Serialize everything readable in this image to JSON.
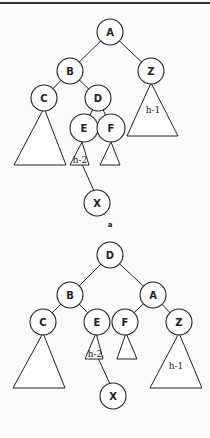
{
  "caption": "a",
  "diagrams": [
    {
      "name": "before-rotation",
      "nodes": {
        "A": {
          "label": "A"
        },
        "B": {
          "label": "B"
        },
        "Z": {
          "label": "Z"
        },
        "C": {
          "label": "C"
        },
        "D": {
          "label": "D"
        },
        "E": {
          "label": "E"
        },
        "F": {
          "label": "F"
        },
        "X": {
          "label": "X"
        }
      },
      "subtrees": {
        "E": "h-2",
        "Z": "h-1"
      }
    },
    {
      "name": "after-rotation",
      "nodes": {
        "D": {
          "label": "D"
        },
        "B": {
          "label": "B"
        },
        "A": {
          "label": "A"
        },
        "C": {
          "label": "C"
        },
        "E": {
          "label": "E"
        },
        "F": {
          "label": "F"
        },
        "Z": {
          "label": "Z"
        },
        "X": {
          "label": "X"
        }
      },
      "subtrees": {
        "E": "h-2",
        "Z": "h-1"
      }
    }
  ]
}
